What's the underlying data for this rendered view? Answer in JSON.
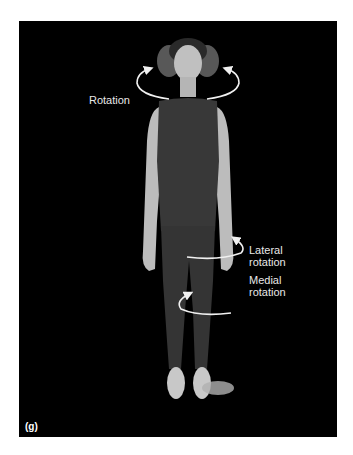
{
  "figure": {
    "panel_label": "(g)",
    "labels": {
      "rotation": "Rotation",
      "lateral_line1": "Lateral",
      "lateral_line2": "rotation",
      "medial_line1": "Medial",
      "medial_line2": "rotation"
    },
    "colors": {
      "background": "#000000",
      "page": "#ffffff",
      "arrow": "#f0f0f0",
      "garment": "#3a3a3a",
      "skin": "#c8c8c8"
    }
  }
}
